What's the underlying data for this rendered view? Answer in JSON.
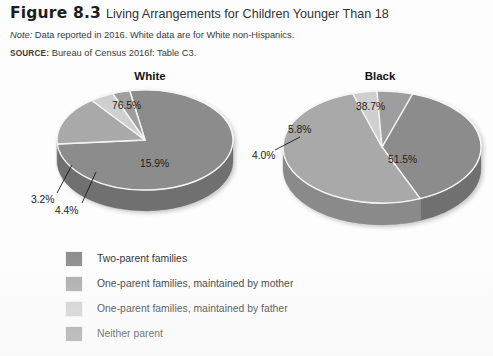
{
  "figure": {
    "label": "Figure 8.3",
    "title": "Living Arrangements for Children Younger Than 18",
    "note_prefix": "Note:",
    "note_text": " Data reported in 2016. White data are for White non-Hispanics.",
    "source_prefix": "SOURCE:",
    "source_text": " Bureau of Census 2016f: Table C3."
  },
  "legend": {
    "items": [
      {
        "label": "Two-parent families",
        "color": "#8c8c8c"
      },
      {
        "label": "One-parent families, maintained by mother",
        "color": "#a9a9a9"
      },
      {
        "label": "One-parent families, maintained by father",
        "color": "#cfcfcf"
      },
      {
        "label": "Neither parent",
        "color": "#9e9e9e"
      }
    ]
  },
  "colors": {
    "two_parent": "#8c8c8c",
    "mother": "#a9a9a9",
    "father": "#cfcfcf",
    "neither": "#9e9e9e",
    "two_parent_side": "#6f6f6f",
    "mother_side": "#8a8a8a",
    "father_side": "#ababab",
    "neither_side": "#7f7f7f",
    "separator": "#f4f4f4",
    "leader": "#1a1a1a"
  },
  "chart_data": [
    {
      "type": "pie",
      "title": "White",
      "labels": [
        "Two-parent families",
        "One-parent families, maintained by mother",
        "One-parent families, maintained by father",
        "Neither parent"
      ],
      "values": [
        76.5,
        15.9,
        4.4,
        3.2
      ],
      "value_labels": [
        "76.5%",
        "15.9%",
        "4.4%",
        "3.2%"
      ],
      "units": "percent",
      "legend_position": "bottom-left",
      "exploded": false,
      "three_d": true
    },
    {
      "type": "pie",
      "title": "Black",
      "labels": [
        "Two-parent families",
        "One-parent families, maintained by mother",
        "One-parent families, maintained by father",
        "Neither parent"
      ],
      "values": [
        38.7,
        51.5,
        4.0,
        5.8
      ],
      "value_labels": [
        "38.7%",
        "51.5%",
        "4.0%",
        "5.8%"
      ],
      "units": "percent",
      "legend_position": "bottom-left",
      "exploded": false,
      "three_d": true
    }
  ],
  "white_chart_labels": {
    "two_parent": "76.5%",
    "mother": "15.9%",
    "father": "4.4%",
    "neither": "3.2%"
  },
  "black_chart_labels": {
    "two_parent": "38.7%",
    "mother": "51.5%",
    "father": "4.0%",
    "neither": "5.8%"
  }
}
